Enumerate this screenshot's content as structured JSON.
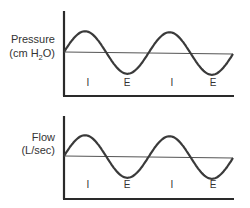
{
  "panels": [
    {
      "id": "pressure",
      "label_line1": "Pressure",
      "label_line2_prefix": "(cm H",
      "label_line2_sub": "2",
      "label_line2_suffix": "O)",
      "phases": [
        "I",
        "E",
        "I",
        "E"
      ]
    },
    {
      "id": "flow",
      "label_line1": "Flow",
      "label_line2_prefix": "(L/sec)",
      "label_line2_sub": "",
      "label_line2_suffix": "",
      "phases": [
        "I",
        "E",
        "I",
        "E"
      ]
    }
  ],
  "waveform": {
    "shape": "sine",
    "cycles": 2,
    "amplitude_relative": 1
  }
}
